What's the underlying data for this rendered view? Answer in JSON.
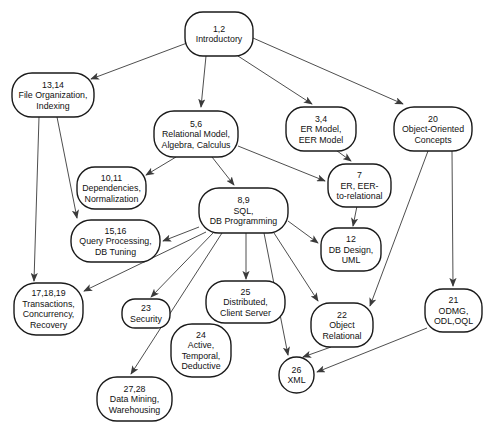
{
  "figure": {
    "width": 491,
    "height": 429,
    "background": "#ffffff",
    "node_fill": "#ffffff",
    "node_stroke": "#1a1a1a",
    "node_stroke_width": 1.4,
    "edge_color": "#3a3a3a",
    "edge_stroke_width": 0.9,
    "line_height": 10.5
  },
  "diagram": {
    "nodes": [
      {
        "id": "1-2",
        "lines": [
          "1,2",
          "Introductory"
        ],
        "x": 185,
        "y": 12,
        "w": 68,
        "h": 44,
        "rx": 18
      },
      {
        "id": "13-14",
        "lines": [
          "13,14",
          "File Organization,",
          "Indexing"
        ],
        "x": 12,
        "y": 73,
        "w": 82,
        "h": 44,
        "rx": 20
      },
      {
        "id": "5-6",
        "lines": [
          "5,6",
          "Relational Model,",
          "Algebra, Calculus"
        ],
        "x": 154,
        "y": 111,
        "w": 84,
        "h": 46,
        "rx": 20
      },
      {
        "id": "3-4",
        "lines": [
          "3,4",
          "ER Model,",
          "EER Model"
        ],
        "x": 286,
        "y": 107,
        "w": 70,
        "h": 44,
        "rx": 18
      },
      {
        "id": "20",
        "lines": [
          "20",
          "Object-Oriented",
          "Concepts"
        ],
        "x": 394,
        "y": 107,
        "w": 78,
        "h": 44,
        "rx": 20
      },
      {
        "id": "10-11",
        "lines": [
          "10,11",
          "Dependencies,",
          "Normalization"
        ],
        "x": 77,
        "y": 167,
        "w": 69,
        "h": 42,
        "rx": 18
      },
      {
        "id": "7",
        "lines": [
          "7",
          "ER, EER-",
          "to-relational"
        ],
        "x": 328,
        "y": 164,
        "w": 63,
        "h": 43,
        "rx": 18
      },
      {
        "id": "8-9",
        "lines": [
          "8,9",
          "SQL,",
          "DB Programming"
        ],
        "x": 199,
        "y": 188,
        "w": 89,
        "h": 45,
        "rx": 20
      },
      {
        "id": "15-16",
        "lines": [
          "15,16",
          "Query Processing,",
          "DB Tuning"
        ],
        "x": 71,
        "y": 220,
        "w": 89,
        "h": 42,
        "rx": 20
      },
      {
        "id": "17-18-19",
        "lines": [
          "17,18,19",
          "Transactions,",
          "Concurrency,",
          "Recovery"
        ],
        "x": 14,
        "y": 283,
        "w": 69,
        "h": 52,
        "rx": 22
      },
      {
        "id": "12",
        "lines": [
          "12",
          "DB Design,",
          "UML"
        ],
        "x": 321,
        "y": 228,
        "w": 60,
        "h": 43,
        "rx": 17
      },
      {
        "id": "23",
        "lines": [
          "23",
          "Security"
        ],
        "x": 122,
        "y": 299,
        "w": 48,
        "h": 29,
        "rx": 13
      },
      {
        "id": "25",
        "lines": [
          "25",
          "Distributed,",
          "Client Server"
        ],
        "x": 206,
        "y": 281,
        "w": 79,
        "h": 42,
        "rx": 19
      },
      {
        "id": "24",
        "lines": [
          "24",
          "Active,",
          "Temporal,",
          "Deductive"
        ],
        "x": 171,
        "y": 324,
        "w": 60,
        "h": 53,
        "rx": 21
      },
      {
        "id": "22",
        "lines": [
          "22",
          "Object",
          "Relational"
        ],
        "x": 311,
        "y": 303,
        "w": 62,
        "h": 44,
        "rx": 19
      },
      {
        "id": "21",
        "lines": [
          "21",
          "ODMG,",
          "ODL,OQL"
        ],
        "x": 425,
        "y": 289,
        "w": 57,
        "h": 43,
        "rx": 18
      },
      {
        "id": "26",
        "lines": [
          "26",
          "XML"
        ],
        "x": 279,
        "y": 357,
        "w": 35,
        "h": 36,
        "rx": 17.5
      },
      {
        "id": "27-28",
        "lines": [
          "27,28",
          "Data Mining,",
          "Warehousing"
        ],
        "x": 97,
        "y": 377,
        "w": 75,
        "h": 44,
        "rx": 20
      }
    ],
    "edges": [
      {
        "from": "1-2",
        "to": "13-14",
        "x1": 187,
        "y1": 43,
        "x2": 91,
        "y2": 79
      },
      {
        "from": "1-2",
        "to": "5-6",
        "x1": 206,
        "y1": 56,
        "x2": 201,
        "y2": 107
      },
      {
        "from": "1-2",
        "to": "3-4",
        "x1": 238,
        "y1": 56,
        "x2": 312,
        "y2": 104
      },
      {
        "from": "1-2",
        "to": "20",
        "x1": 253,
        "y1": 38,
        "x2": 403,
        "y2": 104
      },
      {
        "from": "13-14",
        "to": "15-16",
        "x1": 57,
        "y1": 117,
        "x2": 77,
        "y2": 218
      },
      {
        "from": "13-14",
        "to": "17-18-19",
        "x1": 39,
        "y1": 117,
        "x2": 34,
        "y2": 281
      },
      {
        "from": "5-6",
        "to": "10-11",
        "x1": 176,
        "y1": 157,
        "x2": 146,
        "y2": 175
      },
      {
        "from": "5-6",
        "to": "8-9",
        "x1": 212,
        "y1": 157,
        "x2": 234,
        "y2": 185
      },
      {
        "from": "5-6",
        "to": "7",
        "x1": 238,
        "y1": 146,
        "x2": 325,
        "y2": 181
      },
      {
        "from": "3-4",
        "to": "7",
        "x1": 333,
        "y1": 148,
        "x2": 351,
        "y2": 161
      },
      {
        "from": "20",
        "to": "21",
        "x1": 452,
        "y1": 151,
        "x2": 453,
        "y2": 286
      },
      {
        "from": "20",
        "to": "22",
        "x1": 428,
        "y1": 151,
        "x2": 370,
        "y2": 306
      },
      {
        "from": "7",
        "to": "12",
        "x1": 357,
        "y1": 206,
        "x2": 353,
        "y2": 226
      },
      {
        "from": "8-9",
        "to": "12",
        "x1": 288,
        "y1": 221,
        "x2": 318,
        "y2": 243
      },
      {
        "from": "8-9",
        "to": "15-16",
        "x1": 199,
        "y1": 227,
        "x2": 163,
        "y2": 241
      },
      {
        "from": "8-9",
        "to": "17-18-19",
        "x1": 206,
        "y1": 232,
        "x2": 84,
        "y2": 291
      },
      {
        "from": "8-9",
        "to": "23",
        "x1": 214,
        "y1": 232,
        "x2": 151,
        "y2": 297
      },
      {
        "from": "8-9",
        "to": "27-28",
        "x1": 222,
        "y1": 233,
        "x2": 131,
        "y2": 374
      },
      {
        "from": "8-9",
        "to": "25",
        "x1": 246,
        "y1": 233,
        "x2": 246,
        "y2": 279
      },
      {
        "from": "8-9",
        "to": "22",
        "x1": 274,
        "y1": 233,
        "x2": 318,
        "y2": 301
      },
      {
        "from": "8-9",
        "to": "26",
        "x1": 264,
        "y1": 233,
        "x2": 288,
        "y2": 355
      },
      {
        "from": "22",
        "to": "26",
        "x1": 331,
        "y1": 347,
        "x2": 303,
        "y2": 357
      },
      {
        "from": "21",
        "to": "26",
        "x1": 427,
        "y1": 328,
        "x2": 317,
        "y2": 372
      }
    ]
  }
}
